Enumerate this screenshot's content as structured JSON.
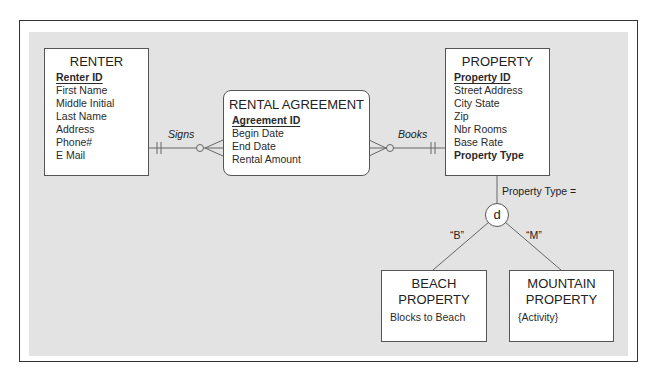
{
  "entities": {
    "renter": {
      "title": "RENTER",
      "primary_key": "Renter ID",
      "attributes": [
        "First Name",
        "Middle Initial",
        "Last Name",
        "Address",
        "Phone#",
        "E Mail"
      ]
    },
    "rental_agreement": {
      "title": "RENTAL AGREEMENT",
      "primary_key": "Agreement ID",
      "attributes": [
        "Begin Date",
        "End Date",
        "Rental Amount"
      ]
    },
    "property": {
      "title": "PROPERTY",
      "primary_key": "Property ID",
      "attributes": [
        "Street Address",
        "City State",
        "Zip",
        "Nbr Rooms",
        "Base Rate"
      ],
      "discriminator_attribute": "Property Type"
    },
    "beach_property": {
      "title_line1": "BEACH",
      "title_line2": "PROPERTY",
      "attributes": [
        "Blocks to Beach"
      ]
    },
    "mountain_property": {
      "title_line1": "MOUNTAIN",
      "title_line2": "PROPERTY",
      "attributes": [
        "{Activity}"
      ]
    }
  },
  "relationships": {
    "signs": "Signs",
    "books": "Books"
  },
  "subtype": {
    "discriminator_label": "Property Type =",
    "constraint": "d",
    "beach_value": "“B”",
    "mountain_value": "“M”"
  }
}
